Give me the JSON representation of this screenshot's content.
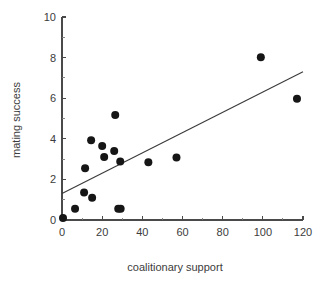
{
  "chart_data": {
    "type": "scatter",
    "title": "",
    "xlabel": "coalitionary support",
    "ylabel": "mating success",
    "xlim": [
      0,
      120
    ],
    "ylim": [
      0,
      10
    ],
    "x_ticks": [
      0,
      20,
      40,
      60,
      80,
      100,
      120
    ],
    "x_tick_labels": [
      "0",
      "20",
      "40",
      "60",
      "80",
      "100",
      "120"
    ],
    "x_minor_ticks": [
      10,
      30,
      50,
      70,
      90,
      110
    ],
    "y_ticks": [
      0,
      2,
      4,
      6,
      8,
      10
    ],
    "y_tick_labels": [
      "0",
      "2",
      "4",
      "6",
      "8",
      "10"
    ],
    "y_minor_ticks": [
      1,
      3,
      5,
      7,
      9
    ],
    "grid": false,
    "legend": false,
    "marker": "filled-circle",
    "marker_color": "#161616",
    "marker_size": 4.0,
    "points": [
      {
        "x": 0.5,
        "y": 0.1
      },
      {
        "x": 6.5,
        "y": 0.55
      },
      {
        "x": 11.0,
        "y": 1.35
      },
      {
        "x": 11.5,
        "y": 2.55
      },
      {
        "x": 14.5,
        "y": 3.93
      },
      {
        "x": 15.0,
        "y": 1.1
      },
      {
        "x": 20.0,
        "y": 3.65
      },
      {
        "x": 21.0,
        "y": 3.1
      },
      {
        "x": 26.0,
        "y": 3.4
      },
      {
        "x": 26.5,
        "y": 5.17
      },
      {
        "x": 28.0,
        "y": 0.55
      },
      {
        "x": 29.2,
        "y": 0.55
      },
      {
        "x": 29.0,
        "y": 2.88
      },
      {
        "x": 43.0,
        "y": 2.85
      },
      {
        "x": 57.0,
        "y": 3.08
      },
      {
        "x": 99.0,
        "y": 8.02
      },
      {
        "x": 117.0,
        "y": 5.97
      }
    ],
    "fit_line": {
      "type": "linear-regression",
      "x_start": 0,
      "y_start": 1.3,
      "x_end": 120,
      "y_end": 7.3,
      "color": "#3a3a3a"
    }
  },
  "figure": {
    "background": "#ffffff",
    "axis_color": "#4a4a4a"
  }
}
